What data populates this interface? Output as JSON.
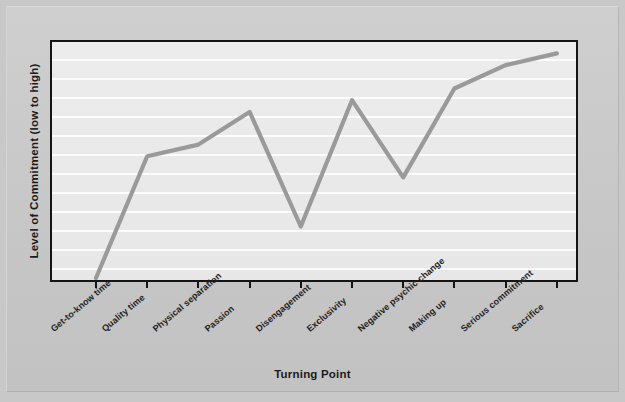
{
  "chart_data": {
    "type": "line",
    "title": "",
    "xlabel": "Turning Point",
    "ylabel": "Level of Commitment (low to high)",
    "categories": [
      "Get-to-know time",
      "Quality time",
      "Physical separation",
      "Passion",
      "Disengagement",
      "Exclusivity",
      "Negative psychic change",
      "Making up",
      "Serious commitment",
      "Sacrifice"
    ],
    "values": [
      0,
      52,
      57,
      71,
      22,
      76,
      43,
      81,
      91,
      96
    ],
    "ylim": [
      0,
      100
    ],
    "xlim": [
      0,
      9
    ],
    "grid": "horizontal",
    "legend": "none",
    "axis_tick_labels_y": [],
    "series": [
      {
        "name": "Level of Commitment",
        "values": [
          0,
          52,
          57,
          71,
          22,
          76,
          43,
          81,
          91,
          96
        ]
      }
    ]
  },
  "style": {
    "line_color": "#9a9a9a",
    "axis_color": "#141414",
    "plot_background": "#e9e9e9",
    "page_background": "#c8c8c8",
    "gridline_color": "#ffffff",
    "text_color": "#1b1b1b"
  }
}
